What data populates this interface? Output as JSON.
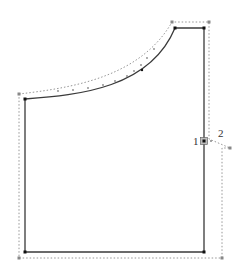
{
  "diagram": {
    "type": "pattern-piece",
    "labels": {
      "point_1": "1",
      "point_2": "2"
    },
    "colors": {
      "outline": "#3a3a3a",
      "seam_allowance": "#8a8a8a",
      "points": "#111111"
    }
  }
}
